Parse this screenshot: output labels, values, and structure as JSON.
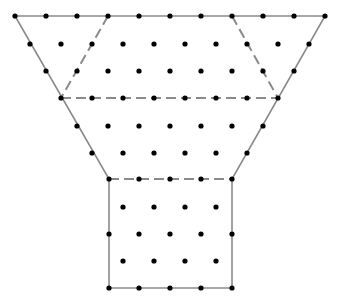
{
  "diagram": {
    "colors": {
      "background": "#ffffff",
      "outline": "#8a8a8a",
      "dashed": "#8a8a8a",
      "dot": "#000000"
    },
    "outline_points": [
      [
        15,
        16
      ],
      [
        325,
        16
      ],
      [
        232,
        179
      ],
      [
        232,
        288
      ],
      [
        109,
        288
      ],
      [
        109,
        179
      ]
    ],
    "dashed_segments": [
      [
        [
          108,
          16
        ],
        [
          61,
          98
        ]
      ],
      [
        [
          232,
          16
        ],
        [
          278,
          98
        ]
      ],
      [
        [
          61,
          98
        ],
        [
          278,
          98
        ]
      ],
      [
        [
          109,
          179
        ],
        [
          232,
          179
        ]
      ]
    ],
    "dot_rows": [
      {
        "y": 16,
        "xs": [
          15,
          46,
          77,
          108,
          139,
          170,
          201,
          232,
          263,
          294,
          325
        ]
      },
      {
        "y": 44,
        "xs": [
          30,
          61,
          92,
          123,
          154,
          185,
          216,
          247,
          278,
          309
        ]
      },
      {
        "y": 71,
        "xs": [
          46,
          77,
          108,
          139,
          170,
          201,
          232,
          263,
          294
        ]
      },
      {
        "y": 98,
        "xs": [
          61,
          92,
          123,
          154,
          185,
          216,
          247,
          278
        ]
      },
      {
        "y": 126,
        "xs": [
          77,
          108,
          139,
          170,
          201,
          232,
          263
        ]
      },
      {
        "y": 153,
        "xs": [
          92,
          123,
          154,
          185,
          216,
          247
        ]
      },
      {
        "y": 179,
        "xs": [
          109,
          139,
          170,
          201,
          232
        ]
      },
      {
        "y": 207,
        "xs": [
          123,
          154,
          185,
          216
        ]
      },
      {
        "y": 234,
        "xs": [
          109,
          139,
          170,
          201,
          232
        ]
      },
      {
        "y": 261,
        "xs": [
          123,
          154,
          185,
          216
        ]
      },
      {
        "y": 288,
        "xs": [
          109,
          139,
          170,
          201,
          232
        ]
      }
    ],
    "regions": [
      {
        "name": "left-triangle",
        "points": [
          [
            15,
            16
          ],
          [
            108,
            16
          ],
          [
            61,
            98
          ]
        ]
      },
      {
        "name": "center-parallelogram",
        "points": [
          [
            108,
            16
          ],
          [
            232,
            16
          ],
          [
            278,
            98
          ],
          [
            61,
            98
          ]
        ]
      },
      {
        "name": "right-triangle",
        "points": [
          [
            232,
            16
          ],
          [
            325,
            16
          ],
          [
            278,
            98
          ]
        ]
      },
      {
        "name": "middle-trapezoid",
        "points": [
          [
            61,
            98
          ],
          [
            278,
            98
          ],
          [
            232,
            179
          ],
          [
            109,
            179
          ]
        ]
      },
      {
        "name": "bottom-rectangle",
        "points": [
          [
            109,
            179
          ],
          [
            232,
            179
          ],
          [
            232,
            288
          ],
          [
            109,
            288
          ]
        ]
      }
    ]
  }
}
